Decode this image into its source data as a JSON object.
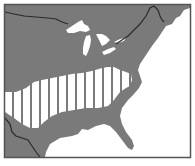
{
  "map": {
    "region": "Eastern United States",
    "legend": null,
    "colors": {
      "land": "#7a7a7a",
      "ocean": "#ffffff",
      "lakes": "#ffffff",
      "border_line": "#2a2a2a",
      "range_fill": "#ffffff",
      "range_stripe": "#7a7a7a",
      "frame": "#555555"
    },
    "features": [
      {
        "name": "land-mass",
        "type": "land"
      },
      {
        "name": "great-lakes",
        "type": "water"
      },
      {
        "name": "atlantic-ocean",
        "type": "water"
      },
      {
        "name": "gulf-of-mexico",
        "type": "water"
      },
      {
        "name": "us-canada-border",
        "type": "boundary"
      },
      {
        "name": "us-mexico-border",
        "type": "boundary"
      },
      {
        "name": "striped-range-band",
        "type": "highlighted-region",
        "pattern": "vertical-stripes"
      }
    ]
  }
}
